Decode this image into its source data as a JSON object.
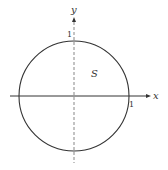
{
  "diagram": {
    "type": "unit-circle",
    "region_label": "S",
    "x_axis_label": "x",
    "y_axis_label": "y",
    "x_tick_label": "1",
    "y_tick_label": "1",
    "colors": {
      "stroke": "#333333",
      "axis_dashed": "#555555",
      "background": "#ffffff"
    }
  }
}
